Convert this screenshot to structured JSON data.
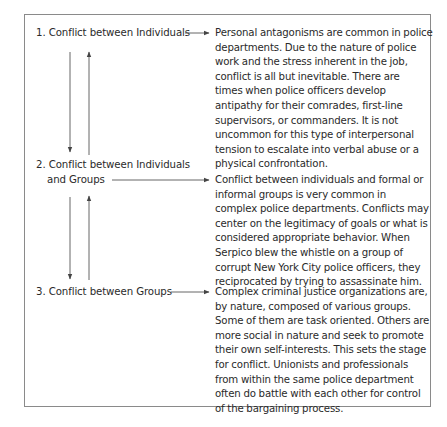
{
  "diagram": {
    "type": "conflict-types",
    "items": [
      {
        "number": "1.",
        "label_lines": [
          "1. Conflict between Individuals"
        ],
        "description_lines": [
          "Personal antagonisms are common in police",
          "departments. Due to the nature of police",
          "work and the stress inherent in the job,",
          "conflict is all but inevitable. There are",
          "times when police officers develop",
          "antipathy for their comrades, first-line",
          "supervisors, or commanders. It is not",
          "uncommon for this type of interpersonal",
          "tension to escalate into verbal abuse or a",
          "physical confrontation."
        ]
      },
      {
        "number": "2.",
        "label_lines": [
          "2. Conflict between Individuals",
          "and Groups"
        ],
        "description_lines": [
          "Conflict between individuals and formal or",
          "informal groups is very common in",
          "complex police departments. Conflicts may",
          "center on the legitimacy of goals or what is",
          "considered appropriate behavior. When",
          "Serpico blew the whistle on a group of",
          "corrupt New York City police officers, they",
          "reciprocated by trying to assassinate him."
        ]
      },
      {
        "number": "3.",
        "label_lines": [
          "3. Conflict between Groups"
        ],
        "description_lines": [
          "Complex criminal justice organizations are,",
          "by nature, composed of various groups.",
          "Some of them are task oriented. Others are",
          "more social in nature and seek to promote",
          "their own self-interests. This sets the stage",
          "for conflict. Unionists and professionals",
          "from within the same police department",
          "often do battle with each other for control",
          "of the bargaining process."
        ]
      }
    ],
    "connectors": [
      {
        "from": "item-1-label",
        "to": "item-1-description",
        "direction": "right"
      },
      {
        "from": "item-2-label",
        "to": "item-2-description",
        "direction": "right"
      },
      {
        "from": "item-3-label",
        "to": "item-3-description",
        "direction": "right"
      },
      {
        "from": "item-1",
        "to": "item-2",
        "direction": "down"
      },
      {
        "from": "item-2",
        "to": "item-1",
        "direction": "up"
      },
      {
        "from": "item-2",
        "to": "item-3",
        "direction": "down"
      },
      {
        "from": "item-3",
        "to": "item-2",
        "direction": "up"
      }
    ],
    "colors": {
      "text": "#2a2a2a",
      "border": "#8a8a8a",
      "arrow": "#555555"
    }
  }
}
